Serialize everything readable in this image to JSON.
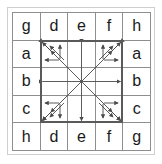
{
  "figure": {
    "colors": {
      "background": "#ffffff",
      "grid_line": "#8e8e8e",
      "bold_square": "#5a5a5a",
      "arrow": "#4a4a4a",
      "letter": "#1a1a1a",
      "outer_frame": "#cfcfcf"
    }
  },
  "grid": {
    "rows": 5,
    "columns": 5,
    "cells": [
      [
        {
          "label": "g",
          "visible": true
        },
        {
          "label": "d",
          "visible": true
        },
        {
          "label": "e",
          "visible": true
        },
        {
          "label": "f",
          "visible": true
        },
        {
          "label": "h",
          "visible": true
        }
      ],
      [
        {
          "label": "a",
          "visible": true
        },
        {
          "label": "",
          "visible": false
        },
        {
          "label": "",
          "visible": false
        },
        {
          "label": "",
          "visible": false
        },
        {
          "label": "a",
          "visible": true
        }
      ],
      [
        {
          "label": "b",
          "visible": true
        },
        {
          "label": "",
          "visible": false
        },
        {
          "label": "",
          "visible": false
        },
        {
          "label": "",
          "visible": false
        },
        {
          "label": "b",
          "visible": true
        }
      ],
      [
        {
          "label": "c",
          "visible": true
        },
        {
          "label": "",
          "visible": false
        },
        {
          "label": "",
          "visible": false
        },
        {
          "label": "",
          "visible": false
        },
        {
          "label": "c",
          "visible": true
        }
      ],
      [
        {
          "label": "h",
          "visible": true
        },
        {
          "label": "d",
          "visible": true
        },
        {
          "label": "e",
          "visible": true
        },
        {
          "label": "f",
          "visible": true
        },
        {
          "label": "g",
          "visible": true
        }
      ]
    ],
    "top_row_labels": [
      "g",
      "d",
      "e",
      "f",
      "h"
    ],
    "bottom_row_labels": [
      "h",
      "d",
      "e",
      "f",
      "g"
    ],
    "left_column_labels": [
      "a",
      "b",
      "c"
    ],
    "right_column_labels": [
      "a",
      "b",
      "c"
    ]
  },
  "inner_square": {
    "label": "bold-3x3-region",
    "span_rows": [
      2,
      4
    ],
    "span_columns": [
      2,
      4
    ]
  },
  "arrows": [
    {
      "name": "arrow-up",
      "direction": "N",
      "double_headed": true
    },
    {
      "name": "arrow-down",
      "direction": "S",
      "double_headed": true
    },
    {
      "name": "arrow-left",
      "direction": "W",
      "double_headed": true
    },
    {
      "name": "arrow-right",
      "direction": "E",
      "double_headed": true
    },
    {
      "name": "arrow-up-left",
      "direction": "NW",
      "double_headed": true
    },
    {
      "name": "arrow-up-right",
      "direction": "NE",
      "double_headed": true
    },
    {
      "name": "arrow-down-left",
      "direction": "SW",
      "double_headed": true
    },
    {
      "name": "arrow-down-right",
      "direction": "SE",
      "double_headed": true
    }
  ]
}
